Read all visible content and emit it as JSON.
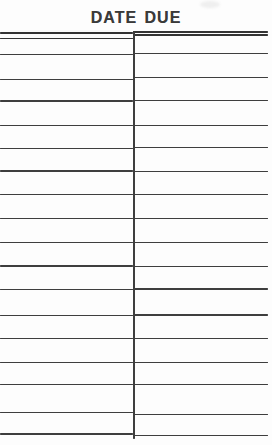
{
  "card": {
    "title": "DATE DUE",
    "table": {
      "columns": 2,
      "rows": 17,
      "header_row_double_ruled": true,
      "all_cells_empty": true
    },
    "colors": {
      "line": "#3e3e3e",
      "top_rule": "#343434",
      "title_text": "#3a3a3a",
      "background": "#fdfdfd"
    }
  }
}
